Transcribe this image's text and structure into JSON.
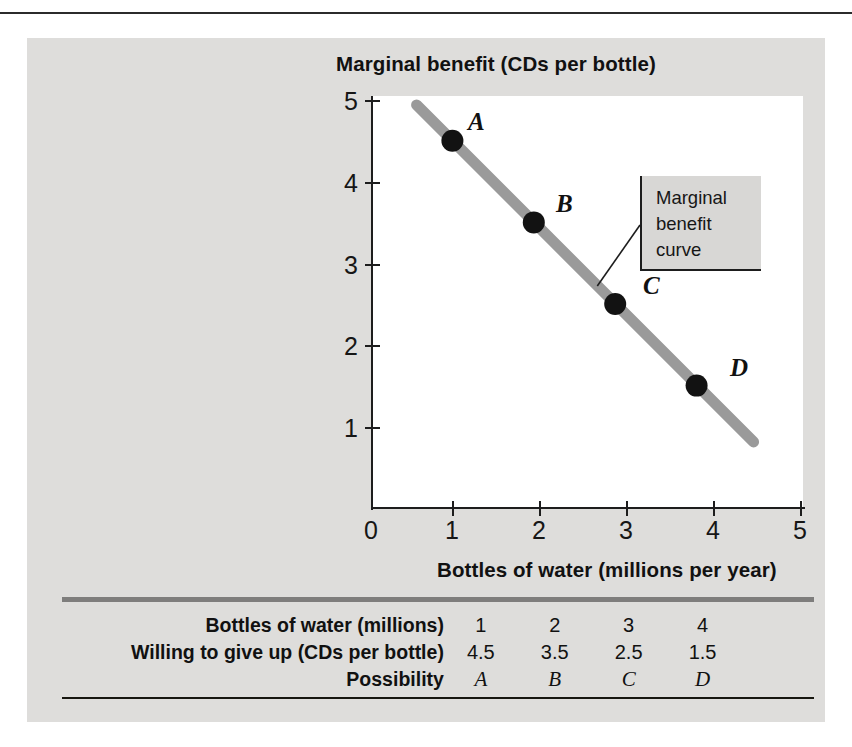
{
  "figure": {
    "y_axis_title": "Marginal benefit (CDs per bottle)",
    "x_axis_title": "Bottles of water (millions per year)",
    "callout": {
      "line1": "Marginal",
      "line2": "benefit",
      "line3": "curve"
    }
  },
  "chart_data": {
    "type": "line",
    "title": "",
    "xlabel": "Bottles of water (millions per year)",
    "ylabel": "Marginal benefit (CDs per bottle)",
    "xlim": [
      0,
      5
    ],
    "ylim": [
      0,
      5
    ],
    "xticks": [
      "0",
      "1",
      "2",
      "3",
      "4",
      "5"
    ],
    "yticks": [
      "1",
      "2",
      "3",
      "4",
      "5"
    ],
    "grid": false,
    "legend": "none",
    "annotation": "Marginal benefit curve",
    "line_color": "#9a9a9a",
    "point_color": "#121212",
    "series": [
      {
        "name": "Marginal benefit curve",
        "x": [
          1,
          2,
          3,
          4
        ],
        "y": [
          4.5,
          3.5,
          2.5,
          1.5
        ],
        "point_labels": [
          "A",
          "B",
          "C",
          "D"
        ]
      }
    ],
    "line_extent": {
      "x_start": 0.56,
      "y_start": 4.94,
      "x_end": 4.7,
      "y_end": 0.81
    }
  },
  "table": {
    "rows": [
      {
        "label": "Bottles of water (millions)",
        "type": "number",
        "values": [
          "1",
          "2",
          "3",
          "4"
        ]
      },
      {
        "label": "Willing to give up (CDs per bottle)",
        "type": "number",
        "values": [
          "4.5",
          "3.5",
          "2.5",
          "1.5"
        ]
      },
      {
        "label": "Possibility",
        "type": "letter",
        "values": [
          "A",
          "B",
          "C",
          "D"
        ]
      }
    ]
  }
}
